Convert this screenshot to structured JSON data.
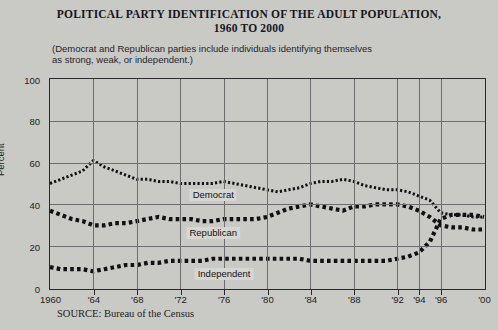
{
  "title": {
    "line1": "POLITICAL PARTY IDENTIFICATION OF THE ADULT POPULATION,",
    "line2": "1960 TO 2000"
  },
  "subtitle": "(Democrat and Republican parties include individuals identifying themselves as strong, weak, or independent.)",
  "source": "SOURCE: Bureau of the Census",
  "colors": {
    "ink": "#1d1d20",
    "grid": "#6d6d70",
    "background": "#c9c9c6",
    "frame": "#2b2b2e"
  },
  "chart_data": {
    "type": "line",
    "title": "POLITICAL PARTY IDENTIFICATION OF THE ADULT POPULATION, 1960 TO 2000",
    "xlabel": "",
    "ylabel": "Percent",
    "ylim": [
      0,
      100
    ],
    "yticks": [
      0,
      20,
      40,
      60,
      80,
      100
    ],
    "xlim": [
      1960,
      2000
    ],
    "xticks": [
      1960,
      1964,
      1968,
      1972,
      1976,
      1980,
      1984,
      1988,
      1992,
      1994,
      1996,
      2000
    ],
    "xticklabels": [
      "1960",
      "'64",
      "'68",
      "'72",
      "'76",
      "'80",
      "'84",
      "'88",
      "'92",
      "'94",
      "'96",
      "'00"
    ],
    "grid": true,
    "legend": "inline-labels",
    "x": [
      1960,
      1961,
      1962,
      1963,
      1964,
      1965,
      1966,
      1967,
      1968,
      1969,
      1970,
      1971,
      1972,
      1973,
      1974,
      1975,
      1976,
      1977,
      1978,
      1979,
      1980,
      1981,
      1982,
      1983,
      1984,
      1985,
      1986,
      1987,
      1988,
      1989,
      1990,
      1991,
      1992,
      1993,
      1994,
      1995,
      1996,
      1997,
      1998,
      1999,
      2000
    ],
    "series": [
      {
        "name": "Democrat",
        "values": [
          50,
          52,
          54,
          56,
          61,
          58,
          56,
          54,
          52,
          52,
          51,
          51,
          50,
          50,
          50,
          50,
          51,
          50,
          49,
          48,
          47,
          46,
          47,
          48,
          50,
          51,
          51,
          52,
          51,
          49,
          48,
          47,
          47,
          46,
          44,
          42,
          36,
          35,
          35,
          34,
          34
        ]
      },
      {
        "name": "Republican",
        "values": [
          37,
          35,
          33,
          32,
          30,
          30,
          31,
          31,
          32,
          33,
          34,
          33,
          33,
          33,
          32,
          32,
          33,
          33,
          33,
          33,
          34,
          36,
          38,
          39,
          40,
          39,
          38,
          37,
          39,
          39,
          40,
          40,
          40,
          39,
          37,
          34,
          30,
          29,
          29,
          28,
          28
        ]
      },
      {
        "name": "Independent",
        "values": [
          10,
          9,
          9,
          9,
          8,
          9,
          10,
          11,
          11,
          12,
          12,
          13,
          13,
          13,
          13,
          14,
          14,
          14,
          14,
          14,
          14,
          14,
          14,
          14,
          13,
          13,
          13,
          13,
          13,
          13,
          13,
          13,
          14,
          15,
          17,
          22,
          33,
          35,
          35,
          35,
          34
        ]
      }
    ]
  }
}
